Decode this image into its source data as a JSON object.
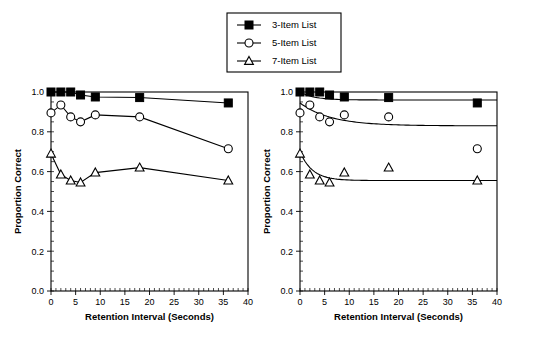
{
  "legend": {
    "position": "top-center",
    "entries": [
      {
        "label": "3-Item List",
        "marker": "filled-square-marker",
        "list_size": 3
      },
      {
        "label": "5-Item List",
        "marker": "open-circle-marker",
        "list_size": 5
      },
      {
        "label": "7-Item List",
        "marker": "open-triangle-marker",
        "list_size": 7
      }
    ]
  },
  "axes": {
    "xlabel": "Retention Interval (Seconds)",
    "ylabel": "Proportion Correct",
    "xlim": [
      0,
      40
    ],
    "ylim": [
      0.0,
      1.0
    ],
    "xticks": [
      0,
      5,
      10,
      15,
      20,
      25,
      30,
      35,
      40
    ],
    "xtick_labels": [
      "0",
      "5",
      "10",
      "15",
      "20",
      "25",
      "30",
      "35",
      "40"
    ],
    "yticks": [
      0.0,
      0.2,
      0.4,
      0.6,
      0.8,
      1.0
    ],
    "ytick_labels": [
      "0.0",
      "0.2",
      "0.4",
      "0.6",
      "0.8",
      "1.0"
    ],
    "minor_x_step": 1,
    "minor_y_step": 0.05,
    "grid": false
  },
  "chart_data": [
    {
      "type": "line",
      "panel": "left",
      "title": "",
      "xlabel": "Retention Interval (Seconds)",
      "ylabel": "Proportion Correct",
      "xlim": [
        0,
        40
      ],
      "ylim": [
        0.0,
        1.0
      ],
      "grid": false,
      "legend_position": "top-center",
      "x": [
        0,
        2,
        4,
        6,
        9,
        18,
        36
      ],
      "series": [
        {
          "name": "3-Item List",
          "marker": "filled-square-marker",
          "connected": true,
          "values": [
            1.0,
            1.0,
            1.0,
            0.985,
            0.975,
            0.972,
            0.945
          ]
        },
        {
          "name": "5-Item List",
          "marker": "open-circle-marker",
          "connected": true,
          "values": [
            0.895,
            0.935,
            0.875,
            0.85,
            0.885,
            0.875,
            0.715
          ]
        },
        {
          "name": "7-Item List",
          "marker": "open-triangle-marker",
          "connected": true,
          "values": [
            0.69,
            0.585,
            0.555,
            0.545,
            0.595,
            0.62,
            0.555
          ]
        }
      ]
    },
    {
      "type": "scatter",
      "panel": "right",
      "title": "",
      "xlabel": "Retention Interval (Seconds)",
      "ylabel": "Proportion Correct",
      "xlim": [
        0,
        40
      ],
      "ylim": [
        0.0,
        1.0
      ],
      "grid": false,
      "legend_position": "top-center",
      "x": [
        0,
        2,
        4,
        6,
        9,
        18,
        36
      ],
      "series": [
        {
          "name": "3-Item List",
          "marker": "filled-square-marker",
          "connected": false,
          "values": [
            1.0,
            1.0,
            1.0,
            0.985,
            0.975,
            0.972,
            0.945
          ],
          "fit_curve": {
            "asymptote": 0.96,
            "start": 1.0,
            "decay_rate": 0.35
          }
        },
        {
          "name": "5-Item List",
          "marker": "open-circle-marker",
          "connected": false,
          "values": [
            0.895,
            0.935,
            0.875,
            0.85,
            0.885,
            0.875,
            0.715
          ],
          "fit_curve": {
            "asymptote": 0.83,
            "start": 0.945,
            "decay_rate": 0.16
          }
        },
        {
          "name": "7-Item List",
          "marker": "open-triangle-marker",
          "connected": false,
          "values": [
            0.69,
            0.585,
            0.555,
            0.545,
            0.595,
            0.62,
            0.555
          ],
          "fit_curve": {
            "asymptote": 0.555,
            "start": 0.7,
            "decay_rate": 0.4
          }
        }
      ]
    }
  ]
}
